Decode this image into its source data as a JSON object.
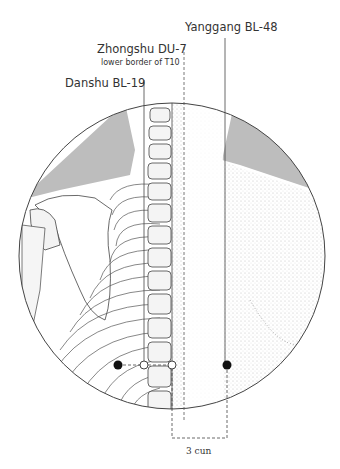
{
  "labels": {
    "yanggang": {
      "name": "Yanggang BL-48"
    },
    "zhongshu": {
      "name": "Zhongshu DU-7",
      "note": "lower border of T10"
    },
    "danshu": {
      "name": "Danshu BL-19"
    },
    "measure": "3 cun"
  },
  "points": [
    {
      "id": "danshu",
      "x": 118,
      "y": 365,
      "style": "filled"
    },
    {
      "id": "inner-bl",
      "x": 144,
      "y": 365,
      "style": "open"
    },
    {
      "id": "zhongshu",
      "x": 172,
      "y": 365,
      "style": "open"
    },
    {
      "id": "yanggang",
      "x": 227,
      "y": 365,
      "style": "filled"
    }
  ],
  "colors": {
    "line": "#444444",
    "shadow": "#bdbdbd",
    "text": "#333333"
  }
}
